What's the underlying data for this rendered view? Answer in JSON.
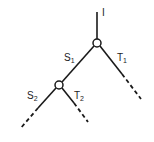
{
  "diagram": {
    "type": "binary-tree",
    "colors": {
      "line": "#1a1a1a",
      "background": "#ffffff"
    },
    "root_label": "I",
    "nodes": [
      {
        "id": "n1",
        "x": 97,
        "y": 43,
        "r": 4
      },
      {
        "id": "n2",
        "x": 59,
        "y": 85,
        "r": 4
      }
    ],
    "edges": [
      {
        "id": "root",
        "label": "I",
        "from": "top",
        "to": "n1"
      },
      {
        "id": "s1",
        "label": "S",
        "sub": "1",
        "from": "n1",
        "to": "n2"
      },
      {
        "id": "t1",
        "label": "T",
        "sub": "1",
        "from": "n1",
        "to": "open",
        "continues": true
      },
      {
        "id": "s2",
        "label": "S",
        "sub": "2",
        "from": "n2",
        "to": "open",
        "continues": true
      },
      {
        "id": "t2",
        "label": "T",
        "sub": "2",
        "from": "n2",
        "to": "open",
        "continues": true
      }
    ],
    "labels": {
      "root": "I",
      "s1_main": "S",
      "s1_sub": "1",
      "t1_main": "T",
      "t1_sub": "1",
      "s2_main": "S",
      "s2_sub": "2",
      "t2_main": "T",
      "t2_sub": "2"
    }
  }
}
